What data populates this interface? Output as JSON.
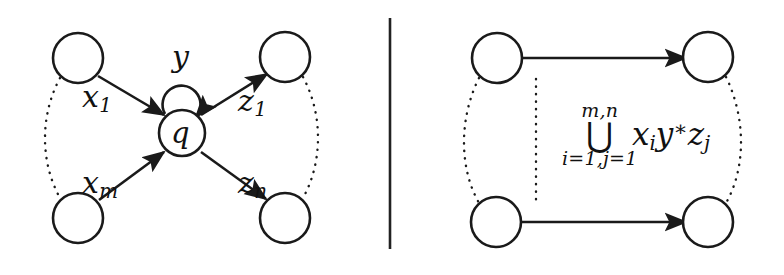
{
  "figure": {
    "background_color": "#ffffff",
    "ink_color": "#1a1a1a",
    "divider": {
      "name": "panel-divider",
      "x": 390,
      "y_top": 18,
      "y_bottom": 249
    }
  },
  "left_panel": {
    "name": "before-elimination",
    "nodes": [
      {
        "id": "in-top",
        "label": "",
        "cx": 78,
        "cy": 58,
        "r": 25
      },
      {
        "id": "in-bottom",
        "label": "",
        "cx": 78,
        "cy": 218,
        "r": 25
      },
      {
        "id": "state-q",
        "label": "q",
        "cx": 182,
        "cy": 133,
        "r": 23
      },
      {
        "id": "out-top",
        "label": "",
        "cx": 285,
        "cy": 57,
        "r": 25
      },
      {
        "id": "out-bottom",
        "label": "",
        "cx": 285,
        "cy": 218,
        "r": 25
      }
    ],
    "self_loop": {
      "label": "y",
      "cx": 182,
      "cy": 100,
      "r": 19
    },
    "edges": [
      {
        "id": "edge-x1",
        "label": "x1",
        "label_text": "x",
        "label_sub": "1",
        "from": "in-top",
        "to": "state-q"
      },
      {
        "id": "edge-xm",
        "label": "xm",
        "label_text": "x",
        "label_sub": "m",
        "from": "in-bottom",
        "to": "state-q"
      },
      {
        "id": "edge-z1",
        "label": "z1",
        "label_text": "z",
        "label_sub": "1",
        "from": "state-q",
        "to": "out-top"
      },
      {
        "id": "edge-zn",
        "label": "zn",
        "label_text": "z",
        "label_sub": "n",
        "from": "state-q",
        "to": "out-bottom"
      }
    ],
    "vertical_dots": [
      {
        "id": "dots-left-in",
        "side": "left"
      },
      {
        "id": "dots-right-out",
        "side": "right"
      }
    ],
    "labels": {
      "x_first": "x",
      "x_first_sub": "1",
      "x_last": "x",
      "x_last_sub": "m",
      "z_first": "z",
      "z_first_sub": "1",
      "z_last": "z",
      "z_last_sub": "n",
      "loop": "y",
      "state": "q"
    }
  },
  "right_panel": {
    "name": "after-elimination",
    "nodes": [
      {
        "id": "r-in-top",
        "label": "",
        "cx": 497,
        "cy": 58,
        "r": 25
      },
      {
        "id": "r-in-bottom",
        "label": "",
        "cx": 496,
        "cy": 222,
        "r": 25
      },
      {
        "id": "r-out-top",
        "label": "",
        "cx": 708,
        "cy": 57,
        "r": 25
      },
      {
        "id": "r-out-bottom",
        "label": "",
        "cx": 708,
        "cy": 222,
        "r": 25
      }
    ],
    "edges": [
      {
        "id": "r-edge-top",
        "from": "r-in-top",
        "to": "r-out-top",
        "label": ""
      },
      {
        "id": "r-edge-bottom",
        "from": "r-in-bottom",
        "to": "r-out-bottom",
        "label": ""
      }
    ],
    "formula": {
      "upper_limit": "m,n",
      "operator": "⋃",
      "lower_limit": "i=1,j=1",
      "expression_x": "x",
      "expression_x_sub": "i",
      "expression_y": "y",
      "expression_star": "∗",
      "expression_z": "z",
      "expression_z_sub": "j",
      "plain": "⋃ i=1,j=1 to m,n  xᵢ y* zⱼ"
    },
    "vertical_dots": [
      {
        "id": "r-dots-left",
        "side": "left"
      },
      {
        "id": "r-dots-middle",
        "side": "middle"
      },
      {
        "id": "r-dots-right",
        "side": "right"
      }
    ]
  }
}
